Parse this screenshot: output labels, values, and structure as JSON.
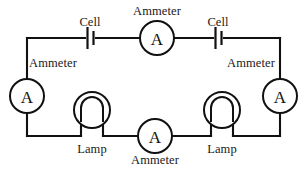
{
  "diagram": {
    "background_color": "#ffffff",
    "line_color": "#111111",
    "text_color": "#1a1a1a"
  },
  "meter_symbol": "A",
  "labels": {
    "cell_left": "Cell",
    "cell_right": "Cell",
    "ammeter_top": "Ammeter",
    "ammeter_left": "Ammeter",
    "ammeter_right": "Ammeter",
    "ammeter_bottom": "Ammeter",
    "lamp_left": "Lamp",
    "lamp_right": "Lamp"
  },
  "components": [
    {
      "name": "cell-left",
      "type": "cell",
      "label": "Cell",
      "x": 90,
      "y": 38
    },
    {
      "name": "ammeter-top",
      "type": "ammeter",
      "label": "Ammeter",
      "x": 157,
      "y": 38
    },
    {
      "name": "cell-right",
      "type": "cell",
      "label": "Cell",
      "x": 218,
      "y": 38
    },
    {
      "name": "ammeter-left",
      "type": "ammeter",
      "label": "Ammeter",
      "x": 27,
      "y": 96
    },
    {
      "name": "ammeter-right",
      "type": "ammeter",
      "label": "Ammeter",
      "x": 280,
      "y": 96
    },
    {
      "name": "lamp-left",
      "type": "lamp",
      "label": "Lamp",
      "x": 92,
      "y": 136
    },
    {
      "name": "ammeter-bottom",
      "type": "ammeter",
      "label": "Ammeter",
      "x": 155,
      "y": 136
    },
    {
      "name": "lamp-right",
      "type": "lamp",
      "label": "Lamp",
      "x": 222,
      "y": 136
    }
  ],
  "circuit_bounds": {
    "left": 27,
    "top": 38,
    "right": 280,
    "bottom": 136
  }
}
